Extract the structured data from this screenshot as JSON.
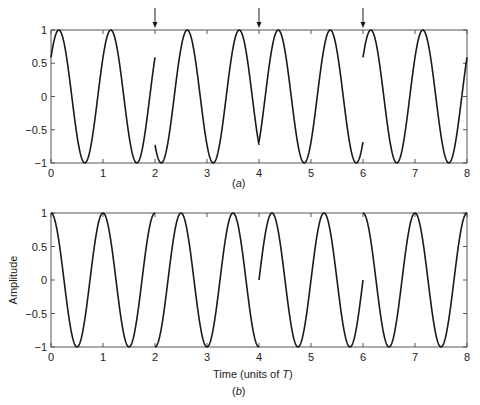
{
  "chart_data": [
    {
      "type": "line",
      "panel_label": "(a)",
      "title": "",
      "xlabel": "",
      "ylabel": "",
      "xlim": [
        0,
        8
      ],
      "ylim": [
        -1,
        1
      ],
      "x_ticks": [
        0,
        1,
        2,
        3,
        4,
        5,
        6,
        7,
        8
      ],
      "y_ticks": [
        1,
        0.5,
        0,
        -0.5,
        -1
      ],
      "y_tick_labels": [
        "1",
        "0.5",
        "0",
        "−0.5",
        "−1"
      ],
      "grid": false,
      "legend": null,
      "annotations": [
        {
          "type": "arrow-down",
          "x": 2
        },
        {
          "type": "arrow-down",
          "x": 4
        },
        {
          "type": "arrow-down",
          "x": 6
        }
      ],
      "series": [
        {
          "name": "segment 0-2",
          "function": "cos(2*pi*(t-0.15))",
          "t_range": [
            0,
            2
          ]
        },
        {
          "name": "segment 2-4",
          "function": "cos(2*pi*(t-2.62))",
          "t_range": [
            2,
            4
          ]
        },
        {
          "name": "segment 4-6",
          "function": "cos(2*pi*(t-4.37))",
          "t_range": [
            4,
            6
          ]
        },
        {
          "name": "segment 6-8",
          "function": "cos(2*pi*(t-6.15))",
          "t_range": [
            6,
            8
          ]
        }
      ]
    },
    {
      "type": "line",
      "panel_label": "(b)",
      "title": "",
      "xlabel": "Time (units of T)",
      "ylabel": "Amplitude",
      "xlim": [
        0,
        8
      ],
      "ylim": [
        -1,
        1
      ],
      "x_ticks": [
        0,
        1,
        2,
        3,
        4,
        5,
        6,
        7,
        8
      ],
      "y_ticks": [
        1,
        0.5,
        0,
        -0.5,
        -1
      ],
      "y_tick_labels": [
        "1",
        "0.5",
        "0",
        "−0.5",
        "−1"
      ],
      "grid": false,
      "legend": null,
      "series": [
        {
          "name": "segment 0-2",
          "function": "cos(2*pi*t)",
          "t_range": [
            0,
            2
          ]
        },
        {
          "name": "segment 2-4",
          "function": "cos(2*pi*(t-2.5))",
          "t_range": [
            2,
            4
          ]
        },
        {
          "name": "segment 4-6",
          "function": "cos(2*pi*(t-4.25))",
          "t_range": [
            4,
            6
          ]
        },
        {
          "name": "segment 6-8",
          "function": "cos(2*pi*(t-6))",
          "t_range": [
            6,
            8
          ]
        }
      ]
    }
  ],
  "labels": {
    "caption_a": "(a)",
    "caption_b": "(b)",
    "xlabel_b_prefix": "Time (units of ",
    "xlabel_b_var": "T",
    "xlabel_b_suffix": ")",
    "ylabel_b": "Amplitude"
  },
  "colors": {
    "curve": "#1a1a1a",
    "axes": "#555555"
  }
}
